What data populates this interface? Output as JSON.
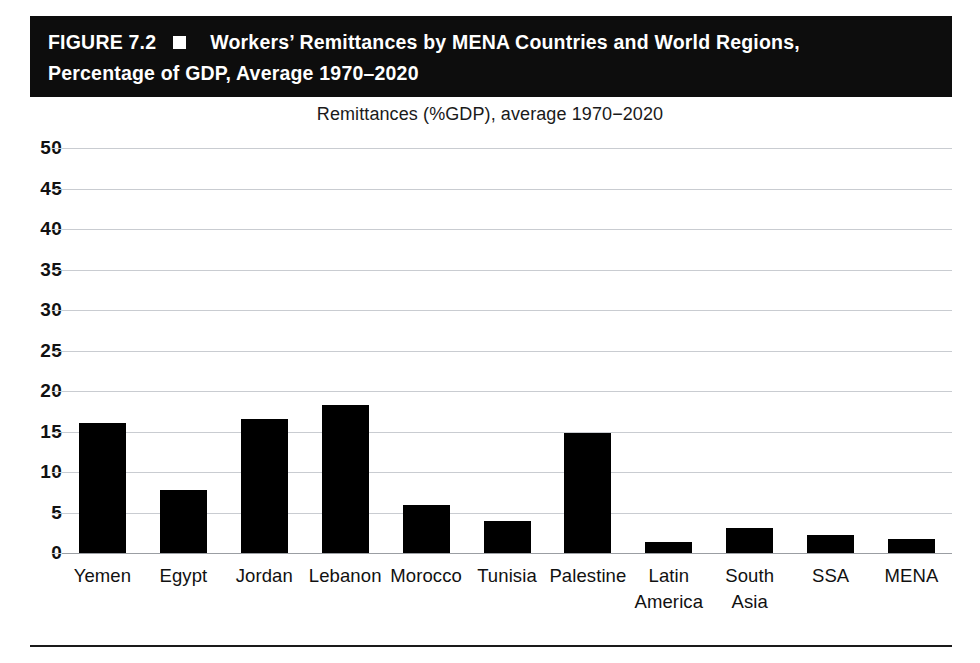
{
  "figure": {
    "label": "FIGURE 7.2",
    "bullet_icon": "filled-square-icon",
    "title_line_1": "Workers’ Remittances by MENA Countries and World Regions,",
    "title_line_2": "Percentage of GDP, Average 1970–2020",
    "banner_color": "#0d0d0d",
    "banner_text_color": "#ffffff"
  },
  "chart_data": {
    "type": "bar",
    "title": "Remittances (%GDP), average 1970−2020",
    "xlabel": "",
    "ylabel": "",
    "ylim": [
      0,
      50
    ],
    "yticks": [
      0,
      5,
      10,
      15,
      20,
      25,
      30,
      35,
      40,
      45,
      50
    ],
    "ytick_labels": [
      "0",
      "5",
      "10",
      "15",
      "20",
      "25",
      "30",
      "35",
      "40",
      "45",
      "50"
    ],
    "grid": true,
    "legend": false,
    "bar_color": "#000000",
    "gridline_color": "#c9ccd1",
    "categories": [
      "Yemen",
      "Egypt",
      "Jordan",
      "Lebanon",
      "Morocco",
      "Tunisia",
      "Palestine",
      "Latin America",
      "South Asia",
      "SSA",
      "MENA"
    ],
    "category_label_lines": [
      [
        "Yemen"
      ],
      [
        "Egypt"
      ],
      [
        "Jordan"
      ],
      [
        "Lebanon"
      ],
      [
        "Morocco"
      ],
      [
        "Tunisia"
      ],
      [
        "Palestine"
      ],
      [
        "Latin",
        "America"
      ],
      [
        "South",
        "Asia"
      ],
      [
        "SSA"
      ],
      [
        "MENA"
      ]
    ],
    "values": [
      16.1,
      7.8,
      16.6,
      18.3,
      5.9,
      4.0,
      14.8,
      1.3,
      3.1,
      2.2,
      1.7
    ]
  }
}
